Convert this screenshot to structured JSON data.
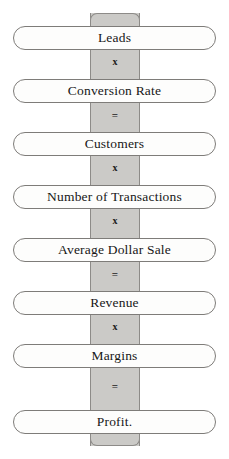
{
  "diagram": {
    "type": "vertical-formula-chain",
    "colors": {
      "spine_fill": "#cbcac7",
      "spine_border": "#8d8b88",
      "pill_fill": "#fdfdfc",
      "pill_border": "#7e7c79",
      "text": "#171717",
      "background": "#ffffff"
    },
    "nodes": [
      {
        "label": "Leads",
        "top": 26
      },
      {
        "label": "Conversion Rate",
        "top": 79
      },
      {
        "label": "Customers",
        "top": 132
      },
      {
        "label": "Number of Transactions",
        "top": 185
      },
      {
        "label": "Average Dollar Sale",
        "top": 238
      },
      {
        "label": "Revenue",
        "top": 291
      },
      {
        "label": "Margins",
        "top": 344
      },
      {
        "label": "Profit.",
        "top": 410
      }
    ],
    "operators": [
      {
        "symbol": "x",
        "kind": "multiply",
        "top": 56
      },
      {
        "symbol": "=",
        "kind": "equals",
        "top": 109
      },
      {
        "symbol": "x",
        "kind": "multiply",
        "top": 162
      },
      {
        "symbol": "x",
        "kind": "multiply",
        "top": 215
      },
      {
        "symbol": "=",
        "kind": "equals",
        "top": 268
      },
      {
        "symbol": "x",
        "kind": "multiply",
        "top": 321
      },
      {
        "symbol": "=",
        "kind": "equals",
        "top": 380
      }
    ]
  }
}
